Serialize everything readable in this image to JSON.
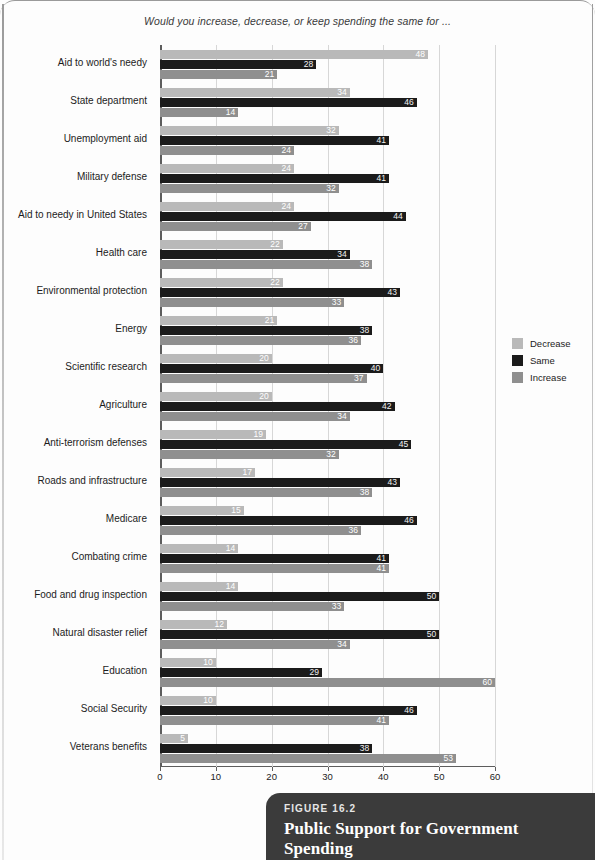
{
  "header": {
    "question": "Would you increase, decrease, or keep spending the same for ..."
  },
  "legend": {
    "position": "right",
    "items": [
      {
        "label": "Decrease",
        "color": "#b9b9b9",
        "key": "decrease"
      },
      {
        "label": "Same",
        "color": "#1b1b1b",
        "key": "same"
      },
      {
        "label": "Increase",
        "color": "#8f8f8f",
        "key": "increase"
      }
    ]
  },
  "caption": {
    "figure_number": "FIGURE 16.2",
    "title": "Public Support for Government Spending"
  },
  "chart_data": {
    "type": "bar",
    "orientation": "horizontal",
    "title": "Public Support for Government Spending",
    "subtitle": "Would you increase, decrease, or keep spending the same for ...",
    "xlabel": "",
    "ylabel": "",
    "xlim": [
      0,
      60
    ],
    "xticks": [
      0,
      10,
      20,
      30,
      40,
      50,
      60
    ],
    "grid": true,
    "legend": [
      "Decrease",
      "Same",
      "Increase"
    ],
    "categories": [
      "Aid to world's needy",
      "State department",
      "Unemployment aid",
      "Military defense",
      "Aid to needy in United States",
      "Health care",
      "Environmental protection",
      "Energy",
      "Scientific research",
      "Agriculture",
      "Anti-terrorism defenses",
      "Roads and infrastructure",
      "Medicare",
      "Combating crime",
      "Food and drug inspection",
      "Natural disaster relief",
      "Education",
      "Social Security",
      "Veterans benefits"
    ],
    "series": [
      {
        "name": "Decrease",
        "color": "#b9b9b9",
        "values": [
          48,
          34,
          32,
          24,
          24,
          22,
          22,
          21,
          20,
          20,
          19,
          17,
          15,
          14,
          14,
          12,
          10,
          10,
          5
        ]
      },
      {
        "name": "Same",
        "color": "#1b1b1b",
        "values": [
          28,
          46,
          41,
          41,
          44,
          34,
          43,
          38,
          40,
          42,
          45,
          43,
          46,
          41,
          50,
          50,
          29,
          46,
          38
        ]
      },
      {
        "name": "Increase",
        "color": "#8f8f8f",
        "values": [
          21,
          14,
          24,
          32,
          27,
          38,
          33,
          36,
          37,
          34,
          32,
          38,
          36,
          41,
          33,
          34,
          60,
          41,
          53
        ]
      }
    ]
  }
}
